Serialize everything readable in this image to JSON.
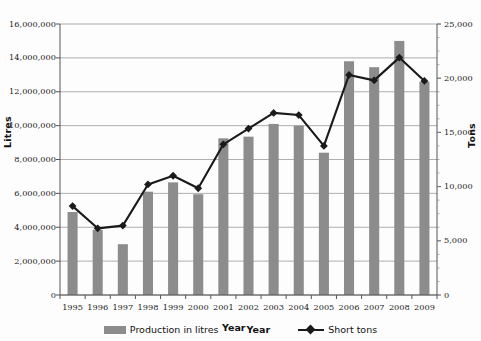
{
  "chart_data": {
    "type": "bar",
    "title": "",
    "xlabel": "Year",
    "ylabel": "Litres",
    "y2label": "Tons",
    "categories": [
      "1995",
      "1996",
      "1997",
      "1998",
      "1999",
      "2000",
      "2001",
      "2002",
      "2003",
      "2004",
      "2005",
      "2006",
      "2007",
      "2008",
      "2009"
    ],
    "ylim": [
      0,
      16000000
    ],
    "y2lim": [
      0,
      25000
    ],
    "grid": true,
    "legend_position": "bottom",
    "y_ticks": [
      "0",
      "2,000,000",
      "4,000,000",
      "6,000,000",
      "8,000,000",
      "10,000,000",
      "12,000,000",
      "14,000,000",
      "16,000,000"
    ],
    "y_tick_values": [
      0,
      2000000,
      4000000,
      6000000,
      8000000,
      10000000,
      12000000,
      14000000,
      16000000
    ],
    "y2_ticks": [
      "0",
      "5,000",
      "10,000",
      "15,000",
      "20,000",
      "25,000"
    ],
    "y2_tick_values": [
      0,
      5000,
      10000,
      15000,
      20000,
      25000
    ],
    "series": [
      {
        "name": "Production in litres",
        "type": "bar",
        "axis": "left",
        "color": "#8c8c8c",
        "values": [
          4900000,
          3850000,
          3000000,
          6100000,
          6650000,
          5950000,
          9250000,
          9350000,
          10100000,
          10000000,
          8400000,
          13800000,
          13450000,
          15000000,
          12600000
        ]
      },
      {
        "name": "Short tons",
        "type": "line",
        "axis": "right",
        "color": "#1a1a1a",
        "marker": "diamond",
        "values": [
          8200,
          6150,
          6400,
          10200,
          11000,
          9850,
          13900,
          15350,
          16800,
          16600,
          13750,
          20300,
          19800,
          21900,
          19750
        ]
      }
    ]
  },
  "legend": {
    "bar_label": "Production in litres",
    "axis_label": "Year",
    "line_label": "Short tons"
  },
  "axes": {
    "left_title": "Litres",
    "right_title": "Tons"
  }
}
